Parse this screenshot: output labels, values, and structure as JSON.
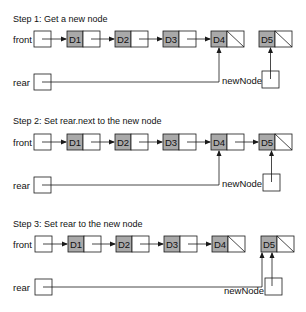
{
  "colors": {
    "node_data_fill": "#a9a9a9",
    "line": "#1a1a1a",
    "background": "#ffffff"
  },
  "labels": {
    "front": "front",
    "rear": "rear",
    "new_node": "newNode"
  },
  "steps": [
    {
      "title": "Step 1: Get a new node",
      "nodes": [
        {
          "data": "D1",
          "next": "pointer"
        },
        {
          "data": "D2",
          "next": "pointer"
        },
        {
          "data": "D3",
          "next": "pointer"
        },
        {
          "data": "D4",
          "next": "null"
        },
        {
          "data": "D5",
          "next": "null",
          "detached": true
        }
      ],
      "rear_points_to": "D4",
      "new_node_points_to": "D5"
    },
    {
      "title": "Step 2: Set rear.next to the new node",
      "nodes": [
        {
          "data": "D1",
          "next": "pointer"
        },
        {
          "data": "D2",
          "next": "pointer"
        },
        {
          "data": "D3",
          "next": "pointer"
        },
        {
          "data": "D4",
          "next": "pointer"
        },
        {
          "data": "D5",
          "next": "null"
        }
      ],
      "rear_points_to": "D4",
      "new_node_points_to": "D5"
    },
    {
      "title": "Step 3: Set rear to the new node",
      "nodes": [
        {
          "data": "D1",
          "next": "pointer"
        },
        {
          "data": "D2",
          "next": "pointer"
        },
        {
          "data": "D3",
          "next": "pointer"
        },
        {
          "data": "D4",
          "next": "null"
        },
        {
          "data": "D5",
          "next": "null",
          "detached": true
        }
      ],
      "rear_points_to": "D5",
      "new_node_points_to": "D5"
    }
  ]
}
